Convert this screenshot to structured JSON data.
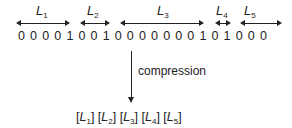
{
  "diagram": {
    "segments": [
      {
        "label": "L",
        "sub": "1",
        "length": 4
      },
      {
        "label": "L",
        "sub": "2",
        "length": 2
      },
      {
        "label": "L",
        "sub": "3",
        "length": 7
      },
      {
        "label": "L",
        "sub": "4",
        "length": 1
      },
      {
        "label": "L",
        "sub": "5",
        "length": 3
      }
    ],
    "bits": [
      "0",
      "0",
      "0",
      "0",
      "1",
      "0",
      "0",
      "1",
      "0",
      "0",
      "0",
      "0",
      "0",
      "0",
      "0",
      "1",
      "0",
      "1",
      "0",
      "0",
      "0"
    ],
    "arrow_label": "compression",
    "result": [
      {
        "label": "L",
        "sub": "1"
      },
      {
        "label": "L",
        "sub": "2"
      },
      {
        "label": "L",
        "sub": "3"
      },
      {
        "label": "L",
        "sub": "4"
      },
      {
        "label": "L",
        "sub": "5"
      }
    ]
  }
}
